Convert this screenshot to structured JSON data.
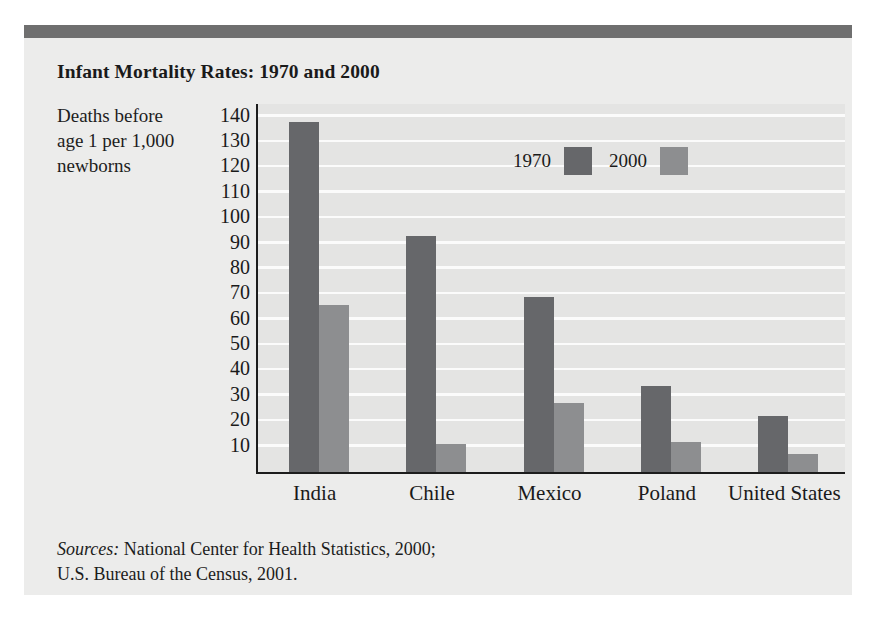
{
  "figure": {
    "title": "Infant Mortality Rates: 1970 and 2000",
    "y_caption_line1": "Deaths before",
    "y_caption_line2": "age 1 per 1,000",
    "y_caption_line3": "newborns",
    "sources_label": "Sources:",
    "sources_line1": " National Center for Health Statistics, 2000;",
    "sources_line2": "U.S. Bureau of the Census, 2001."
  },
  "colors": {
    "series_1970": "#66676a",
    "series_2000": "#8d8e90",
    "header_band": "#6f6f6f",
    "card_background": "#ececeb",
    "plot_background": "#e4e4e3",
    "gridline": "#fbfbfb",
    "axis": "#1c1c1c"
  },
  "chart_data": {
    "type": "bar",
    "title": "Infant Mortality Rates: 1970 and 2000",
    "xlabel": "",
    "ylabel": "Deaths before age 1 per 1,000 newborns",
    "categories": [
      "India",
      "Chile",
      "Mexico",
      "Poland",
      "United States"
    ],
    "series": [
      {
        "name": "1970",
        "values": [
          138,
          93,
          69,
          34,
          22
        ]
      },
      {
        "name": "2000",
        "values": [
          66,
          11,
          27,
          12,
          7
        ]
      }
    ],
    "ylim": [
      0,
      145
    ],
    "yticks": [
      10,
      20,
      30,
      40,
      50,
      60,
      70,
      80,
      90,
      100,
      110,
      120,
      130,
      140
    ],
    "ytick_labels": [
      "10",
      "20",
      "30",
      "40",
      "50",
      "60",
      "70",
      "80",
      "90",
      "100",
      "110",
      "120",
      "130",
      "140"
    ],
    "grid": true,
    "legend": [
      "1970",
      "2000"
    ],
    "legend_position": "inside-top-center"
  }
}
